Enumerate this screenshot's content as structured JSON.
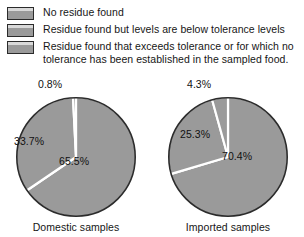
{
  "legend": {
    "items": [
      {
        "swatch": "gray-swatch",
        "label": "No residue found",
        "color": "#9a9a9a"
      },
      {
        "swatch": "gray-swatch",
        "label": "Residue found but levels are below tolerance levels",
        "color": "#9a9a9a"
      },
      {
        "swatch": "gray-swatch",
        "label": "Residue found that exceeds tolerance or for which no\ntolerance has been established in the sampled food.",
        "color": "#9a9a9a"
      }
    ]
  },
  "chart_data": [
    {
      "type": "pie",
      "title": "Domestic samples",
      "categories": [
        "No residue found",
        "Residue found but levels are below tolerance levels",
        "Residue found that exceeds tolerance or for which no tolerance has been established in the sampled food."
      ],
      "values": [
        65.5,
        33.7,
        0.8
      ],
      "labels": [
        "65.5%",
        "33.7%",
        "0.8%"
      ],
      "slice_color": "#9a9a9a",
      "separator_color": "#ffffff",
      "outline_color": "#2b2b2b",
      "start_angle_deg": 0,
      "direction": "clockwise",
      "legend_position": "top"
    },
    {
      "type": "pie",
      "title": "Imported samples",
      "categories": [
        "No residue found",
        "Residue found but levels are below tolerance levels",
        "Residue found that exceeds tolerance or for which no tolerance has been established in the sampled food."
      ],
      "values": [
        70.4,
        25.3,
        4.3
      ],
      "labels": [
        "70.4%",
        "25.3%",
        "4.3%"
      ],
      "slice_color": "#9a9a9a",
      "separator_color": "#ffffff",
      "outline_color": "#2b2b2b",
      "start_angle_deg": 0,
      "direction": "clockwise",
      "legend_position": "top"
    }
  ],
  "charts": {
    "domestic": {
      "caption": "Domestic samples",
      "label_major": "65.5%",
      "label_middle": "33.7%",
      "label_minor": "0.8%"
    },
    "imported": {
      "caption": "Imported samples",
      "label_major": "70.4%",
      "label_middle": "25.3%",
      "label_minor": "4.3%"
    }
  }
}
